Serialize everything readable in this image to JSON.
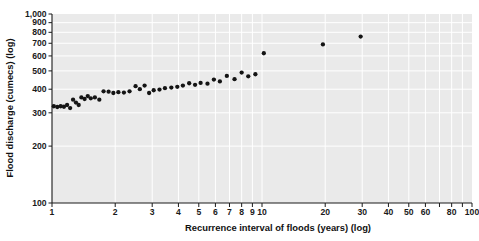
{
  "chart_data": {
    "type": "scatter",
    "title": "",
    "subtitle": "",
    "xlabel": "Recurrence interval of floods (years) (log)",
    "ylabel": "Flood discharge (cumecs) (log)",
    "xscale": "log",
    "yscale": "log",
    "xlim": [
      1,
      100
    ],
    "ylim": [
      100,
      1000
    ],
    "grid": true,
    "grid_color": "#ffffff",
    "plot_background": "#eaeaea",
    "legend": null,
    "marker_color": "#141414",
    "marker_shape": "circle",
    "xticks": [
      1,
      2,
      3,
      4,
      5,
      6,
      7,
      8,
      9,
      10,
      20,
      30,
      40,
      50,
      60,
      70,
      80,
      90,
      100
    ],
    "xticklabels": [
      "1",
      "2",
      "3",
      "4",
      "5",
      "6",
      "7",
      "8",
      "9",
      "10",
      "20",
      "30",
      "40",
      "50",
      "60",
      "",
      "80",
      "",
      "100"
    ],
    "yticks": [
      100,
      200,
      300,
      400,
      500,
      600,
      700,
      800,
      900,
      1000
    ],
    "yticklabels": [
      "100",
      "200",
      "300",
      "400",
      "500",
      "600",
      "700",
      "800",
      "900",
      "1,000"
    ],
    "series": [
      {
        "name": "Flood discharge vs recurrence interval",
        "points": [
          [
            1.02,
            325
          ],
          [
            1.06,
            322
          ],
          [
            1.1,
            325
          ],
          [
            1.14,
            323
          ],
          [
            1.18,
            330
          ],
          [
            1.22,
            318
          ],
          [
            1.26,
            352
          ],
          [
            1.3,
            340
          ],
          [
            1.34,
            330
          ],
          [
            1.38,
            362
          ],
          [
            1.43,
            355
          ],
          [
            1.48,
            368
          ],
          [
            1.53,
            358
          ],
          [
            1.6,
            362
          ],
          [
            1.68,
            352
          ],
          [
            1.76,
            390
          ],
          [
            1.86,
            388
          ],
          [
            1.96,
            382
          ],
          [
            2.07,
            386
          ],
          [
            2.2,
            384
          ],
          [
            2.34,
            390
          ],
          [
            2.5,
            415
          ],
          [
            2.62,
            400
          ],
          [
            2.76,
            418
          ],
          [
            2.9,
            382
          ],
          [
            3.05,
            395
          ],
          [
            3.25,
            398
          ],
          [
            3.45,
            405
          ],
          [
            3.7,
            408
          ],
          [
            3.95,
            412
          ],
          [
            4.2,
            418
          ],
          [
            4.5,
            430
          ],
          [
            4.8,
            422
          ],
          [
            5.1,
            432
          ],
          [
            5.5,
            428
          ],
          [
            5.9,
            450
          ],
          [
            6.3,
            440
          ],
          [
            6.8,
            470
          ],
          [
            7.4,
            452
          ],
          [
            8.0,
            490
          ],
          [
            8.6,
            468
          ],
          [
            9.3,
            480
          ],
          [
            10.2,
            620
          ],
          [
            19.5,
            690
          ],
          [
            29.5,
            760
          ]
        ]
      }
    ]
  },
  "axes": {
    "y_title": "Flood discharge (cumecs) (log)",
    "x_title": "Recurrence interval of floods (years) (log)"
  }
}
